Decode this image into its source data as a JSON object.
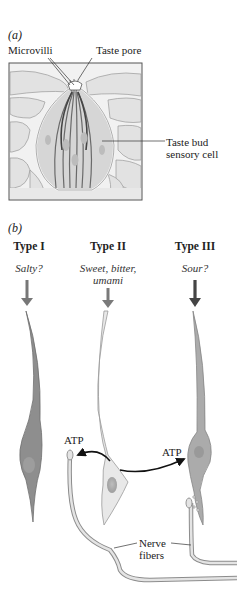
{
  "panel_a": {
    "label": "(a)",
    "labels": {
      "microvilli": "Microvilli",
      "taste_pore": "Taste pore",
      "sensory_cell_line1": "Taste bud",
      "sensory_cell_line2": "sensory cell"
    }
  },
  "panel_b": {
    "label": "(b)",
    "cell_types": [
      {
        "title": "Type I",
        "taste": "Salty?",
        "color": "#8a8a8a",
        "arrow_color": "#777777"
      },
      {
        "title": "Type II",
        "taste_line1": "Sweet, bitter,",
        "taste_line2": "umami",
        "color": "#e6e6e6",
        "arrow_color": "#7a7a7a"
      },
      {
        "title": "Type III",
        "taste": "Sour?",
        "color": "#a8a8a8",
        "arrow_color": "#444444"
      }
    ],
    "labels": {
      "atp_left": "ATP",
      "atp_right": "ATP",
      "nerve_line1": "Nerve",
      "nerve_line2": "fibers"
    }
  }
}
